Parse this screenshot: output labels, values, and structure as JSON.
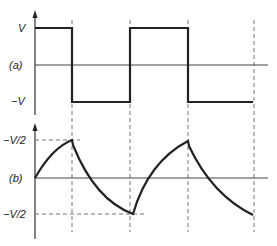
{
  "diagram": {
    "panel_a": {
      "label": "(a)",
      "y_labels": {
        "top": "V",
        "bottom": "−V"
      },
      "waveform": "square",
      "transitions_x": [
        72,
        130,
        188,
        255
      ]
    },
    "panel_b": {
      "label": "(b)",
      "y_labels": {
        "top": "−V/2",
        "bottom": "−V/2"
      },
      "waveform": "exponential charge/discharge"
    },
    "colors": {
      "line": "#222222",
      "dashed": "#666666",
      "axis": "#333333"
    }
  }
}
